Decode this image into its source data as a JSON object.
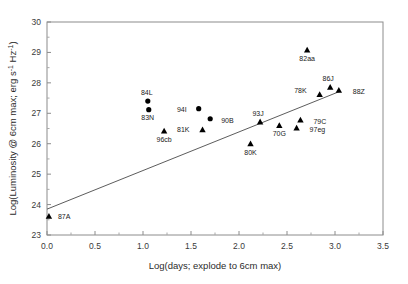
{
  "chart_data": {
    "type": "scatter",
    "title": "",
    "xlabel": "Log(days; explode to 6cm max)",
    "ylabel": "Log(Luminosity @ 6cm max; erg s-1 Hz-1)",
    "ylabel_parts": {
      "pre": "Log(Luminosity @ 6cm max; erg s",
      "sup1": "-1",
      "mid": " Hz",
      "sup2": "-1",
      "post": ")"
    },
    "xlim": [
      0.0,
      3.5
    ],
    "ylim": [
      23,
      30
    ],
    "xticks": [
      "0.0",
      "0.5",
      "1.0",
      "1.5",
      "2.0",
      "2.5",
      "3.0",
      "3.5"
    ],
    "xtick_values": [
      0.0,
      0.5,
      1.0,
      1.5,
      2.0,
      2.5,
      3.0,
      3.5
    ],
    "yticks": [
      "23",
      "24",
      "25",
      "26",
      "27",
      "28",
      "29",
      "30"
    ],
    "ytick_values": [
      23,
      24,
      25,
      26,
      27,
      28,
      29,
      30
    ],
    "grid": false,
    "legend": "none",
    "fit_line": {
      "x0": 0.0,
      "y0": 23.85,
      "x1": 3.05,
      "y1": 27.72
    },
    "points": [
      {
        "label": "87A",
        "x": 0.02,
        "y": 23.62,
        "marker": "triangle",
        "label_dx": 9,
        "label_dy": 3
      },
      {
        "label": "84L",
        "x": 1.05,
        "y": 27.4,
        "marker": "circle",
        "label_dx": -1,
        "label_dy": -6
      },
      {
        "label": "83N",
        "x": 1.06,
        "y": 27.12,
        "marker": "circle",
        "label_dx": -1,
        "label_dy": 10
      },
      {
        "label": "96cb",
        "x": 1.22,
        "y": 26.42,
        "marker": "triangle",
        "label_dx": 0,
        "label_dy": 11
      },
      {
        "label": "94I",
        "x": 1.58,
        "y": 27.15,
        "marker": "circle",
        "label_dx": -12,
        "label_dy": 3
      },
      {
        "label": "90B",
        "x": 1.7,
        "y": 26.82,
        "marker": "circle",
        "label_dx": 11,
        "label_dy": 4
      },
      {
        "label": "81K",
        "x": 1.62,
        "y": 26.46,
        "marker": "triangle",
        "label_dx": -13,
        "label_dy": 2
      },
      {
        "label": "80K",
        "x": 2.12,
        "y": 26.0,
        "marker": "triangle",
        "label_dx": 0,
        "label_dy": 11
      },
      {
        "label": "93J",
        "x": 2.22,
        "y": 26.72,
        "marker": "triangle",
        "label_dx": -2,
        "label_dy": -6
      },
      {
        "label": "70G",
        "x": 2.42,
        "y": 26.6,
        "marker": "triangle",
        "label_dx": 0,
        "label_dy": 11
      },
      {
        "label": "97eg",
        "x": 2.6,
        "y": 26.52,
        "marker": "triangle",
        "label_dx": 13,
        "label_dy": 4
      },
      {
        "label": "79C",
        "x": 2.64,
        "y": 26.78,
        "marker": "triangle",
        "label_dx": 13,
        "label_dy": 4
      },
      {
        "label": "82aa",
        "x": 2.71,
        "y": 29.08,
        "marker": "triangle",
        "label_dx": 0,
        "label_dy": 11
      },
      {
        "label": "78K",
        "x": 2.84,
        "y": 27.62,
        "marker": "triangle",
        "label_dx": -13,
        "label_dy": -1
      },
      {
        "label": "86J",
        "x": 2.95,
        "y": 27.86,
        "marker": "triangle",
        "label_dx": -2,
        "label_dy": -6
      },
      {
        "label": "88Z",
        "x": 3.04,
        "y": 27.76,
        "marker": "triangle",
        "label_dx": 14,
        "label_dy": 4
      }
    ]
  }
}
